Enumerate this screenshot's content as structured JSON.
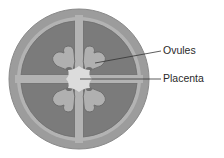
{
  "diagram": {
    "labels": {
      "ovules": "Ovules",
      "placenta": "Placenta"
    },
    "colors": {
      "outer_wall": "#9c9c9c",
      "outer_edge": "#8a8a8a",
      "locule": "#7b7b7b",
      "septum": "#b3b3b3",
      "ovule": "#b0b0b0",
      "ovule_outline": "#6a6a6a",
      "placenta": "#dcdcdc",
      "leader_line": "#333333"
    }
  }
}
